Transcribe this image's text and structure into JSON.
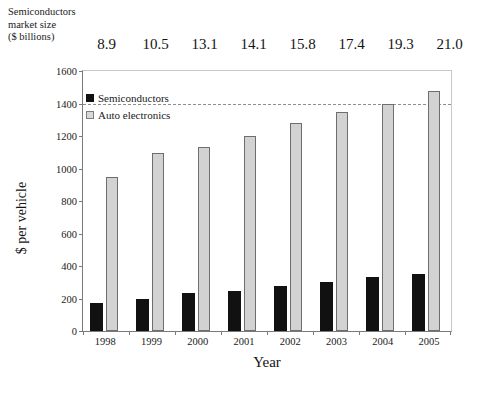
{
  "header": {
    "caption_lines": [
      "Semiconductors",
      "market size",
      "($ billions)"
    ],
    "values": [
      "8.9",
      "10.5",
      "13.1",
      "14.1",
      "15.8",
      "17.4",
      "19.3",
      "21.0"
    ]
  },
  "legend": {
    "items": [
      {
        "label": "Semiconductors",
        "color": "#111111",
        "swatch": "filled-square"
      },
      {
        "label": "Auto electronics",
        "color": "#d8d8d8",
        "swatch": "outlined-square"
      }
    ]
  },
  "axes": {
    "y_title": "$ per vehicle",
    "x_title": "Year",
    "y_ticks": [
      "0",
      "200",
      "400",
      "600",
      "800",
      "1000",
      "1200",
      "1400",
      "1600"
    ]
  },
  "chart_data": {
    "type": "bar",
    "title": "",
    "xlabel": "Year",
    "ylabel": "$ per vehicle",
    "categories": [
      "1998",
      "1999",
      "2000",
      "2001",
      "2002",
      "2003",
      "2004",
      "2005"
    ],
    "series": [
      {
        "name": "Semiconductors",
        "color": "#111111",
        "values": [
          175,
          200,
          237,
          248,
          275,
          300,
          330,
          352
        ]
      },
      {
        "name": "Auto electronics",
        "color": "#d2d2d2",
        "values": [
          945,
          1095,
          1130,
          1200,
          1280,
          1345,
          1400,
          1480
        ]
      }
    ],
    "secondary_annotation": {
      "label_lines": [
        "Semiconductors",
        "market size",
        "($ billions)"
      ],
      "values": [
        8.9,
        10.5,
        13.1,
        14.1,
        15.8,
        17.4,
        19.3,
        21.0
      ]
    },
    "ylim": [
      0,
      1600
    ],
    "ytick_step": 200,
    "grid": false,
    "reference_line": {
      "value": 1400,
      "style": "dashed"
    },
    "legend_position": "top-left-inside"
  }
}
